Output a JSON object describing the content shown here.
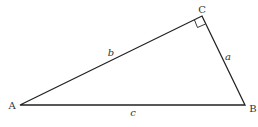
{
  "diagram": {
    "type": "right-triangle",
    "vertices": {
      "A": {
        "label": "A",
        "x": 20,
        "y": 105
      },
      "B": {
        "label": "B",
        "x": 245,
        "y": 105
      },
      "C": {
        "label": "C",
        "x": 202,
        "y": 16
      }
    },
    "sides": {
      "a": {
        "label": "a",
        "between": [
          "B",
          "C"
        ]
      },
      "b": {
        "label": "b",
        "between": [
          "A",
          "C"
        ]
      },
      "c": {
        "label": "c",
        "between": [
          "A",
          "B"
        ]
      }
    },
    "right_angle_at": "C",
    "line_color": "#222222"
  }
}
